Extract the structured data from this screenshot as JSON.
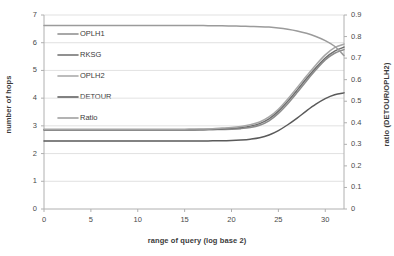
{
  "chart_data": {
    "type": "line",
    "title": "",
    "xlabel": "range of query (log base 2)",
    "ylabel": "number of hops",
    "ylabel_secondary": "ratio (DETOUR/OPLH2)",
    "xlim": [
      0,
      32
    ],
    "ylim": [
      0,
      7
    ],
    "ylim_secondary": [
      0,
      0.9
    ],
    "xticks": [
      0,
      5,
      10,
      15,
      20,
      25,
      30
    ],
    "xtick_labels": [
      "0",
      "5",
      "10",
      "15",
      "20",
      "25",
      "30"
    ],
    "yticks": [
      0,
      1,
      2,
      3,
      4,
      5,
      6,
      7
    ],
    "ytick_labels": [
      "0",
      "1",
      "2",
      "3",
      "4",
      "5",
      "6",
      "7"
    ],
    "yticks_secondary": [
      0,
      0.1,
      0.2,
      0.3,
      0.4,
      0.5,
      0.6,
      0.7,
      0.8,
      0.9
    ],
    "ytick_labels_secondary": [
      "0",
      "0.1",
      "0.2",
      "0.3",
      "0.4",
      "0.5",
      "0.6",
      "0.7",
      "0.8",
      "0.9"
    ],
    "grid": "horizontal",
    "legend_position": "upper-left-inside",
    "x": [
      0,
      1,
      2,
      3,
      4,
      5,
      6,
      7,
      8,
      9,
      10,
      11,
      12,
      13,
      14,
      15,
      16,
      17,
      18,
      19,
      20,
      21,
      22,
      23,
      24,
      25,
      26,
      27,
      28,
      29,
      30,
      31,
      32
    ],
    "series": [
      {
        "name": "OPLH1",
        "axis": "left",
        "color": "#8c8c8c",
        "values": [
          2.85,
          2.85,
          2.85,
          2.85,
          2.85,
          2.85,
          2.85,
          2.85,
          2.85,
          2.85,
          2.85,
          2.85,
          2.85,
          2.85,
          2.85,
          2.85,
          2.85,
          2.85,
          2.86,
          2.87,
          2.88,
          2.9,
          2.94,
          3.02,
          3.18,
          3.45,
          3.8,
          4.2,
          4.62,
          5.02,
          5.38,
          5.62,
          5.75
        ]
      },
      {
        "name": "RKSG",
        "axis": "left",
        "color": "#6e6e6e",
        "values": [
          2.86,
          2.86,
          2.86,
          2.86,
          2.86,
          2.86,
          2.86,
          2.86,
          2.86,
          2.86,
          2.86,
          2.86,
          2.86,
          2.86,
          2.86,
          2.86,
          2.86,
          2.87,
          2.88,
          2.89,
          2.91,
          2.94,
          2.99,
          3.08,
          3.25,
          3.53,
          3.89,
          4.29,
          4.71,
          5.1,
          5.45,
          5.7,
          5.84
        ]
      },
      {
        "name": "OPLH2",
        "axis": "left",
        "color": "#a6a6a6",
        "values": [
          2.88,
          2.88,
          2.88,
          2.88,
          2.88,
          2.88,
          2.88,
          2.88,
          2.88,
          2.88,
          2.88,
          2.88,
          2.88,
          2.88,
          2.88,
          2.88,
          2.89,
          2.89,
          2.9,
          2.92,
          2.94,
          2.98,
          3.04,
          3.14,
          3.32,
          3.6,
          3.97,
          4.38,
          4.8,
          5.2,
          5.56,
          5.82,
          5.95
        ]
      },
      {
        "name": "DETOUR",
        "axis": "left",
        "color": "#5a5a5a",
        "values": [
          2.45,
          2.45,
          2.45,
          2.45,
          2.45,
          2.45,
          2.45,
          2.45,
          2.45,
          2.45,
          2.45,
          2.45,
          2.45,
          2.45,
          2.45,
          2.45,
          2.45,
          2.45,
          2.46,
          2.46,
          2.47,
          2.49,
          2.52,
          2.57,
          2.67,
          2.83,
          3.04,
          3.28,
          3.54,
          3.78,
          3.98,
          4.12,
          4.19
        ]
      },
      {
        "name": "Ratio",
        "axis": "right",
        "color": "#9b9b9b",
        "values": [
          0.851,
          0.851,
          0.851,
          0.851,
          0.851,
          0.851,
          0.851,
          0.851,
          0.851,
          0.851,
          0.851,
          0.851,
          0.851,
          0.851,
          0.851,
          0.851,
          0.851,
          0.851,
          0.85,
          0.85,
          0.849,
          0.848,
          0.847,
          0.846,
          0.844,
          0.84,
          0.834,
          0.826,
          0.815,
          0.8,
          0.781,
          0.755,
          0.712
        ]
      }
    ]
  },
  "legend": {
    "items": [
      {
        "label": "OPLH1"
      },
      {
        "label": "RKSG"
      },
      {
        "label": "OPLH2"
      },
      {
        "label": "DETOUR"
      },
      {
        "label": "Ratio"
      }
    ]
  },
  "colors": {
    "grid": "#d9d9d9",
    "axis": "#b0b0b0",
    "text": "#3f3f3f",
    "background": "#ffffff"
  }
}
